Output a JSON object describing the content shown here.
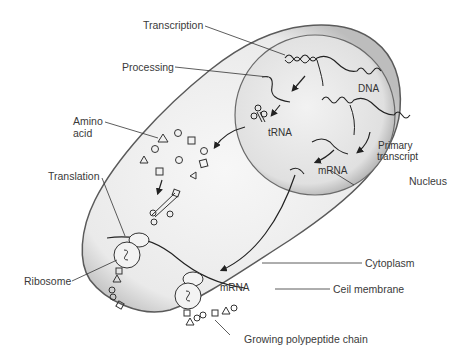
{
  "diagram": {
    "labels": {
      "transcription": "Transcription",
      "processing": "Processing",
      "amino_acid_line1": "Amino",
      "amino_acid_line2": "acid",
      "translation": "Translation",
      "ribosome": "Ribosome",
      "dna": "DNA",
      "trna": "tRNA",
      "primary_transcript_line1": "Primary",
      "primary_transcript_line2": "transcript",
      "mrna_nucleus": "mRNA",
      "nucleus": "Nucleus",
      "mrna_cytoplasm": "mRNA",
      "cytoplasm": "Cytoplasm",
      "cell_membrane": "Ceil membrane",
      "growing_chain": "Growing polypeptide chain"
    },
    "colors": {
      "background": "#ffffff",
      "cell_fill": "#ebebeb",
      "cell_edge": "#5a5a5a",
      "nucleus_fill": "#e4e4e4",
      "ink": "#222222",
      "label_text": "#3a3a3a"
    }
  }
}
